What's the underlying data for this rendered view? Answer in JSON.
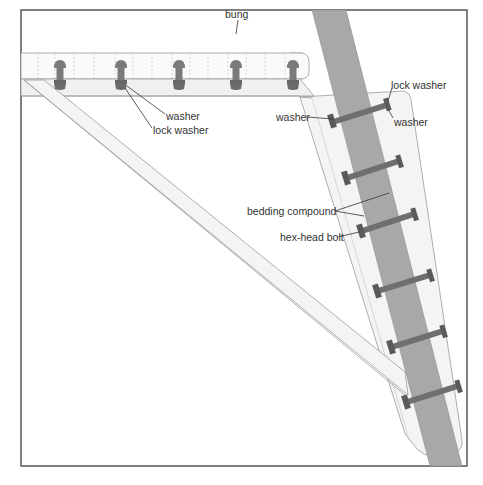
{
  "diagram": {
    "type": "technical-illustration",
    "colors": {
      "frame": "#555555",
      "mast": "#a8a8a8",
      "bolt": "#7a7a7a",
      "bolt_dark": "#555555",
      "wood_fill": "#f2f2f2",
      "wood_line": "#9a9a9a",
      "leader": "#333333",
      "text": "#333333"
    },
    "labels": {
      "bung": "bung",
      "washer_top": "washer",
      "lock_washer_top": "lock washer",
      "washer_left": "washer",
      "lock_washer_right": "lock washer",
      "washer_right": "washer",
      "bedding_compound": "bedding compound",
      "hex_head_bolt": "hex-head bolt"
    },
    "top_bolts": [
      {
        "x": 60
      },
      {
        "x": 121
      },
      {
        "x": 179
      },
      {
        "x": 236
      },
      {
        "x": 293
      }
    ],
    "mast_bolts": [
      {
        "y1": 142,
        "y2": 122
      },
      {
        "y1": 189,
        "y2": 169
      },
      {
        "y1": 233,
        "y2": 214
      },
      {
        "y1": 293,
        "y2": 274
      },
      {
        "y1": 350,
        "y2": 331
      },
      {
        "y1": 404,
        "y2": 385
      }
    ]
  }
}
